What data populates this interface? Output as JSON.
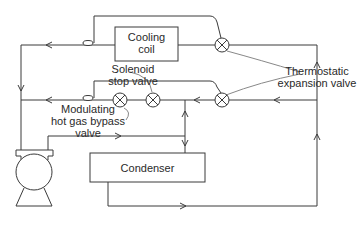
{
  "diagram": {
    "components": {
      "cooling_coil": "Cooling\ncoil",
      "condenser": "Condenser",
      "compressor": "compressor"
    },
    "labels": {
      "solenoid": [
        "Solenoid",
        "stop valve"
      ],
      "bypass": [
        "Modulating",
        "hot gas bypass",
        "valve"
      ],
      "thermostatic": [
        "Thermostatic",
        "expansion valve"
      ]
    },
    "colors": {
      "line": "#3a3a3a",
      "background": "#ffffff"
    }
  }
}
